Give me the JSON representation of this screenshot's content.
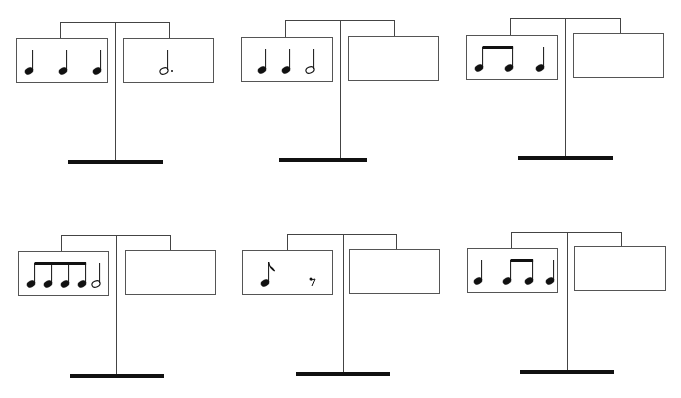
{
  "colors": {
    "ink": "#111111",
    "line": "#444444"
  },
  "scales": [
    {
      "id": 1,
      "frame": {
        "barLeft": 60,
        "barRight": 168,
        "barTop": 22,
        "poleX": 115,
        "poleBottom": 160,
        "baseLeft": 68,
        "baseRight": 163,
        "baseTop": 160
      },
      "left": {
        "x": 16,
        "y": 38,
        "w": 92,
        "h": 45,
        "notes": [
          {
            "type": "quarter",
            "x": 12
          },
          {
            "type": "quarter",
            "x": 46
          },
          {
            "type": "quarter",
            "x": 80
          }
        ],
        "label": "quarter quarter quarter"
      },
      "right": {
        "x": 123,
        "y": 38,
        "w": 91,
        "h": 45,
        "notes": [
          {
            "type": "dotted-half",
            "x": 40
          }
        ],
        "label": "dotted half"
      }
    },
    {
      "id": 2,
      "frame": {
        "barLeft": 285,
        "barRight": 393,
        "barTop": 20,
        "poleX": 340,
        "poleBottom": 158,
        "baseLeft": 279,
        "baseRight": 367,
        "baseTop": 158
      },
      "left": {
        "x": 241,
        "y": 37,
        "w": 92,
        "h": 45,
        "notes": [
          {
            "type": "quarter",
            "x": 20
          },
          {
            "type": "quarter",
            "x": 44
          },
          {
            "type": "half",
            "x": 68
          }
        ],
        "label": "quarter quarter half"
      },
      "right": {
        "x": 348,
        "y": 36,
        "w": 91,
        "h": 45,
        "notes": [],
        "label": ""
      }
    },
    {
      "id": 3,
      "frame": {
        "barLeft": 510,
        "barRight": 619,
        "barTop": 18,
        "poleX": 565,
        "poleBottom": 156,
        "baseLeft": 518,
        "baseRight": 613,
        "baseTop": 156
      },
      "left": {
        "x": 466,
        "y": 35,
        "w": 92,
        "h": 45,
        "notes": [
          {
            "type": "eighth-pair",
            "x": 12,
            "x2": 42
          },
          {
            "type": "quarter",
            "x": 73
          }
        ],
        "label": "eighth eighth quarter"
      },
      "right": {
        "x": 573,
        "y": 33,
        "w": 91,
        "h": 45,
        "notes": [],
        "label": ""
      }
    },
    {
      "id": 4,
      "frame": {
        "barLeft": 61,
        "barRight": 169,
        "barTop": 235,
        "poleX": 116,
        "poleBottom": 374,
        "baseLeft": 70,
        "baseRight": 164,
        "baseTop": 374
      },
      "left": {
        "x": 18,
        "y": 251,
        "w": 91,
        "h": 45,
        "notes": [
          {
            "type": "eighth-group",
            "xs": [
              12,
              29,
              46,
              63
            ]
          },
          {
            "type": "half",
            "x": 77
          }
        ],
        "label": "four eighths half"
      },
      "right": {
        "x": 125,
        "y": 250,
        "w": 91,
        "h": 45,
        "notes": [],
        "label": ""
      }
    },
    {
      "id": 5,
      "frame": {
        "barLeft": 287,
        "barRight": 395,
        "barTop": 234,
        "poleX": 343,
        "poleBottom": 372,
        "baseLeft": 296,
        "baseRight": 390,
        "baseTop": 372
      },
      "left": {
        "x": 242,
        "y": 250,
        "w": 91,
        "h": 45,
        "notes": [
          {
            "type": "eighth",
            "x": 22
          },
          {
            "type": "eighth-rest",
            "x": 68
          }
        ],
        "label": "eighth eighth-rest"
      },
      "right": {
        "x": 349,
        "y": 249,
        "w": 91,
        "h": 45,
        "notes": [],
        "label": ""
      }
    },
    {
      "id": 6,
      "frame": {
        "barLeft": 511,
        "barRight": 620,
        "barTop": 232,
        "poleX": 567,
        "poleBottom": 370,
        "baseLeft": 520,
        "baseRight": 614,
        "baseTop": 370
      },
      "left": {
        "x": 467,
        "y": 248,
        "w": 91,
        "h": 45,
        "notes": [
          {
            "type": "quarter",
            "x": 10
          },
          {
            "type": "eighth-pair",
            "x": 39,
            "x2": 61
          },
          {
            "type": "quarter",
            "x": 82
          }
        ],
        "label": "quarter eighth eighth quarter"
      },
      "right": {
        "x": 574,
        "y": 246,
        "w": 92,
        "h": 45,
        "notes": [],
        "label": ""
      }
    }
  ]
}
